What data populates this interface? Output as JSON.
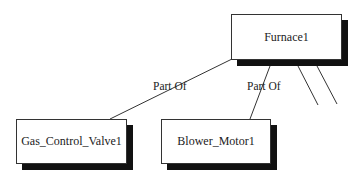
{
  "nodes": {
    "furnace": {
      "label": "Furnace1"
    },
    "gas_valve": {
      "label": "Gas_Control_Valve1"
    },
    "blower": {
      "label": "Blower_Motor1"
    }
  },
  "edges": [
    {
      "from": "gas_valve",
      "to": "furnace",
      "label": "Part Of"
    },
    {
      "from": "blower",
      "to": "furnace",
      "label": "Part Of"
    },
    {
      "from": "unseen",
      "to": "furnace",
      "label": ""
    },
    {
      "from": "unseen",
      "to": "furnace",
      "label": ""
    }
  ]
}
